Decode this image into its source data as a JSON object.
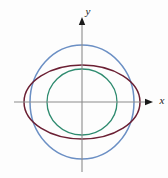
{
  "figure": {
    "background_color": "#fdfdfd",
    "title": "",
    "axes": {
      "x_label": "x",
      "y_label": "y",
      "axis_color": "#8c8c8c",
      "arrow_color": "#1a1a1a",
      "origin_x": 82,
      "origin_y": 102,
      "x_axis_start": 14,
      "x_axis_end": 148,
      "y_axis_start": 22,
      "y_axis_end": 172,
      "ticks_shown": false,
      "grid_shown": false
    }
  },
  "chart_data": {
    "type": "line",
    "title": "",
    "xlabel": "x",
    "ylabel": "y",
    "grid": false,
    "legend_position": "none",
    "coordinate_system": "cartesian",
    "origin_pixel": [
      82,
      102
    ],
    "xlim": [
      -68,
      66
    ],
    "ylim": [
      -70,
      80
    ],
    "series": [
      {
        "name": "outer-circle",
        "shape": "circle",
        "color": "#6b8fc4",
        "stroke_width": 1.5,
        "center": [
          0,
          0
        ],
        "semi_axis_x": 52,
        "semi_axis_y": 57,
        "x_intercepts": [
          -52,
          52
        ],
        "y_intercepts": [
          -57,
          57
        ]
      },
      {
        "name": "wide-ellipse",
        "shape": "ellipse",
        "color": "#6b1f33",
        "stroke_width": 1.5,
        "center": [
          0,
          0
        ],
        "semi_axis_x": 58,
        "semi_axis_y": 37,
        "x_intercepts": [
          -58,
          58
        ],
        "y_intercepts": [
          -37,
          37
        ]
      },
      {
        "name": "inner-circle",
        "shape": "circle",
        "color": "#2e8b6f",
        "stroke_width": 1.3,
        "center": [
          0,
          0
        ],
        "semi_axis_x": 35,
        "semi_axis_y": 33,
        "x_intercepts": [
          -35,
          35
        ],
        "y_intercepts": [
          -33,
          33
        ]
      }
    ]
  }
}
